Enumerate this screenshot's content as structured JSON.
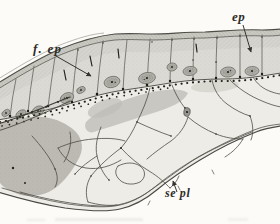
{
  "figure": {
    "labels": {
      "f_ep": "f. ep",
      "ep": "ep",
      "se_pl": "se pl"
    }
  },
  "palette": {
    "paper": "#fcfbf8",
    "ink": "#2e2d28",
    "cell": "#dbdad4",
    "cuticle": "#cac9c2",
    "nucleus": "#b1b0a9",
    "shade": "#bcbab3",
    "plexus_field": "#edece7"
  }
}
